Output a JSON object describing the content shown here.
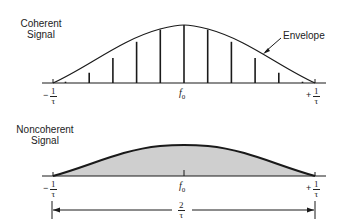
{
  "coherent": {
    "title_line1": "Coherent",
    "title_line2": "Signal",
    "envelope_label": "Envelope",
    "left_label": {
      "sign": "−",
      "num": "1",
      "den": "τ"
    },
    "center_label": {
      "base": "f",
      "sub": "0"
    },
    "right_label": {
      "sign": "+",
      "num": "1",
      "den": "τ"
    },
    "spectral_lines_count": 11
  },
  "noncoherent": {
    "title_line1": "Noncoherent",
    "title_line2": "Signal",
    "left_label": {
      "sign": "−",
      "num": "1",
      "den": "τ"
    },
    "center_label": {
      "base": "f",
      "sub": "0"
    },
    "right_label": {
      "sign": "+",
      "num": "1",
      "den": "τ"
    },
    "bandwidth_label": {
      "num": "2",
      "den": "τ"
    },
    "fill_color": "#cfcfcf"
  },
  "colors": {
    "stroke": "#1a1a1a",
    "fill": "#cfcfcf"
  }
}
